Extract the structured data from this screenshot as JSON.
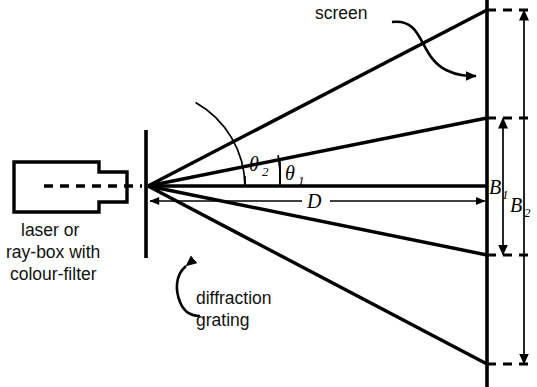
{
  "diagram": {
    "labels": {
      "screen": "screen",
      "source_line1": "laser or",
      "source_line2": "ray-box with",
      "source_line3": "colour-filter",
      "grating_line1": "diffraction",
      "grating_line2": "grating",
      "distance": "D",
      "angle_first_order": "θ",
      "angle_first_order_sub": "1",
      "angle_second_order": "θ",
      "angle_second_order_sub": "2",
      "band_first": "B",
      "band_first_sub": "1",
      "band_second": "B",
      "band_second_sub": "2"
    },
    "colors": {
      "ink": "#000000",
      "background": "#ffffff",
      "text": "#111111"
    },
    "geometry": {
      "grating_x": 146,
      "screen_x": 487,
      "axis_y": 186,
      "vertex_x": 148,
      "vertex_y": 186,
      "distance_D_px": 339,
      "first_order_up_y": 118,
      "first_order_down_y": 255,
      "second_order_up_y": 10,
      "second_order_down_y": 364,
      "B1_span_px": 137,
      "B2_span_px": 354
    },
    "orders": [
      {
        "name": "second-order-up",
        "angle_label": "θ2",
        "screen_y": 10
      },
      {
        "name": "first-order-up",
        "angle_label": "θ1",
        "screen_y": 118
      },
      {
        "name": "zero-order",
        "angle_label": "",
        "screen_y": 186
      },
      {
        "name": "first-order-down",
        "angle_label": "",
        "screen_y": 255
      },
      {
        "name": "second-order-down",
        "angle_label": "",
        "screen_y": 364
      }
    ]
  }
}
